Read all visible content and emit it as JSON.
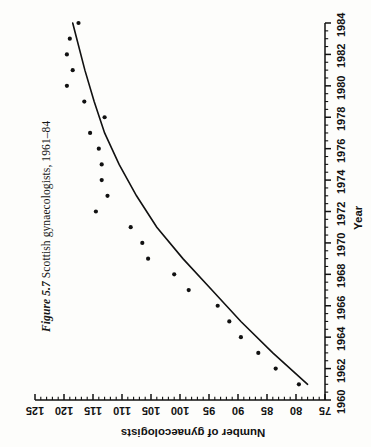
{
  "figure": {
    "caption_number": "Figure 5.7",
    "caption_text": "Scottish gynaecologists, 1961–84",
    "orientation": "rotated-90-ccw",
    "background_color": "#fdfdfb",
    "ink_color": "#111111"
  },
  "chart_data": {
    "type": "scatter",
    "title": "Figure 5.7 Scottish gynaecologists, 1961–84",
    "xlabel": "Year",
    "ylabel": "Number of gynaecologists",
    "xlim": [
      1960,
      1984
    ],
    "ylim": [
      75,
      125
    ],
    "grid": false,
    "legend": null,
    "x_ticks": [
      1960,
      1962,
      1964,
      1966,
      1968,
      1970,
      1972,
      1974,
      1976,
      1978,
      1980,
      1982,
      1984
    ],
    "x_minor_tick_step": 0.5,
    "y_ticks": [
      125,
      120,
      115,
      110,
      105,
      100,
      95,
      90,
      85,
      80,
      75
    ],
    "y_minor_tick_step": 1,
    "y_axis_direction": "decreasing-left-to-right",
    "series": [
      {
        "name": "Observed gynaecologists",
        "marker": "filled-circle",
        "x": [
          1961,
          1962,
          1963,
          1964,
          1965,
          1966,
          1967,
          1968,
          1969,
          1970,
          1971,
          1972,
          1973,
          1974,
          1975,
          1976,
          1977,
          1978,
          1979,
          1980,
          1981,
          1982,
          1983,
          1984
        ],
        "values": [
          79.5,
          83.5,
          86.5,
          89.5,
          91.5,
          93.5,
          98.5,
          101.0,
          105.5,
          106.5,
          108.5,
          114.5,
          112.5,
          113.5,
          113.5,
          114.0,
          115.5,
          113.0,
          116.5,
          119.5,
          118.5,
          119.5,
          119.0,
          117.5
        ]
      },
      {
        "name": "Fitted exponential curve",
        "type": "line",
        "x": [
          1961,
          1963,
          1965,
          1967,
          1969,
          1971,
          1973,
          1975,
          1977,
          1979,
          1981,
          1983,
          1984
        ],
        "values": [
          78.0,
          84.0,
          89.5,
          94.5,
          99.5,
          104.0,
          107.5,
          110.5,
          113.0,
          114.8,
          116.4,
          117.8,
          118.5
        ]
      }
    ]
  },
  "axes": {
    "x": {
      "label": "Year",
      "ticks": [
        "1960",
        "1962",
        "1964",
        "1966",
        "1968",
        "1970",
        "1972",
        "1974",
        "1976",
        "1978",
        "1980",
        "1982",
        "1984"
      ]
    },
    "y": {
      "label": "Number of gynaecologists",
      "ticks": [
        "125",
        "120",
        "115",
        "110",
        "105",
        "100",
        "95",
        "90",
        "85",
        "80",
        "75"
      ]
    }
  }
}
